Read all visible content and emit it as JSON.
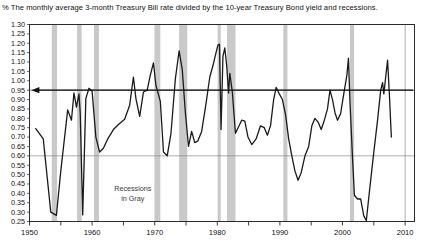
{
  "chart_data": {
    "type": "line",
    "title": "The monthly average 3-month Treasury Bill rate divided by the 10-year Treasury Bond yield and recessions.",
    "unit_symbol": "%",
    "xlabel": "",
    "ylabel": "",
    "xlim": [
      1950,
      2011.5
    ],
    "ylim": [
      0.25,
      1.3
    ],
    "grid": true,
    "gridlines_y": [
      0.6,
      0.95
    ],
    "gridlines_x": [
      2010
    ],
    "legend_position": "none",
    "annotations": [
      {
        "name": "recessions-in-gray",
        "text_line1": "Recessions",
        "text_line2": "in Gray",
        "x": 1966.5,
        "y": 0.4
      },
      {
        "name": "level-arrow",
        "text": "",
        "y": 0.95,
        "direction": "left",
        "x_start": 2011.3,
        "x_end": 1950.3
      }
    ],
    "ytick_labels": [
      "1.30",
      "1.25",
      "1.20",
      "1.15",
      "1.10",
      "1.05",
      "1.00",
      "0.95",
      "0.90",
      "0.85",
      "0.80",
      "0.75",
      "0.70",
      "0.65",
      "0.60",
      "0.55",
      "0.50",
      "0.45",
      "0.40",
      "0.35",
      "0.30",
      "0.25"
    ],
    "ytick_values": [
      1.3,
      1.25,
      1.2,
      1.15,
      1.1,
      1.05,
      1.0,
      0.95,
      0.9,
      0.85,
      0.8,
      0.75,
      0.7,
      0.65,
      0.6,
      0.55,
      0.5,
      0.45,
      0.4,
      0.35,
      0.3,
      0.25
    ],
    "xtick_labels": [
      "1950",
      "1960",
      "1970",
      "1980",
      "1990",
      "2000",
      "2010"
    ],
    "xtick_values": [
      1950,
      1960,
      1970,
      1980,
      1990,
      2000,
      2010
    ],
    "xminor_values": [
      1955,
      1965,
      1975,
      1985,
      1995,
      2005
    ],
    "series": [
      {
        "name": "3-month T-Bill rate / 10-year T-Bond yield",
        "color": "#1a1a1a",
        "points": [
          [
            1951.0,
            0.745
          ],
          [
            1952.2,
            0.69
          ],
          [
            1953.4,
            0.3
          ],
          [
            1954.3,
            0.283
          ],
          [
            1955.0,
            0.52
          ],
          [
            1956.1,
            0.845
          ],
          [
            1956.7,
            0.79
          ],
          [
            1957.1,
            0.935
          ],
          [
            1957.5,
            0.86
          ],
          [
            1957.9,
            0.93
          ],
          [
            1958.1,
            0.83
          ],
          [
            1958.5,
            0.285
          ],
          [
            1959.0,
            0.905
          ],
          [
            1959.5,
            0.96
          ],
          [
            1960.0,
            0.945
          ],
          [
            1960.6,
            0.7
          ],
          [
            1961.2,
            0.62
          ],
          [
            1961.8,
            0.64
          ],
          [
            1962.5,
            0.69
          ],
          [
            1963.4,
            0.74
          ],
          [
            1964.3,
            0.77
          ],
          [
            1965.2,
            0.795
          ],
          [
            1966.0,
            0.87
          ],
          [
            1966.6,
            1.02
          ],
          [
            1967.0,
            0.905
          ],
          [
            1967.6,
            0.81
          ],
          [
            1968.2,
            0.94
          ],
          [
            1968.8,
            0.95
          ],
          [
            1969.3,
            1.03
          ],
          [
            1969.8,
            1.095
          ],
          [
            1970.2,
            0.975
          ],
          [
            1970.9,
            0.89
          ],
          [
            1971.4,
            0.62
          ],
          [
            1972.0,
            0.6
          ],
          [
            1972.6,
            0.72
          ],
          [
            1973.3,
            1.01
          ],
          [
            1973.9,
            1.16
          ],
          [
            1974.4,
            1.06
          ],
          [
            1974.9,
            0.83
          ],
          [
            1975.4,
            0.65
          ],
          [
            1975.9,
            0.73
          ],
          [
            1976.4,
            0.67
          ],
          [
            1976.9,
            0.68
          ],
          [
            1977.5,
            0.73
          ],
          [
            1978.2,
            0.88
          ],
          [
            1978.8,
            1.02
          ],
          [
            1979.3,
            1.08
          ],
          [
            1979.8,
            1.15
          ],
          [
            1980.1,
            1.19
          ],
          [
            1980.35,
            1.195
          ],
          [
            1980.6,
            0.74
          ],
          [
            1980.9,
            1.13
          ],
          [
            1981.2,
            1.175
          ],
          [
            1981.5,
            1.08
          ],
          [
            1981.8,
            0.935
          ],
          [
            1982.0,
            1.04
          ],
          [
            1982.4,
            0.94
          ],
          [
            1982.9,
            0.72
          ],
          [
            1983.4,
            0.755
          ],
          [
            1983.9,
            0.79
          ],
          [
            1984.4,
            0.785
          ],
          [
            1984.9,
            0.7
          ],
          [
            1985.5,
            0.66
          ],
          [
            1986.2,
            0.69
          ],
          [
            1986.9,
            0.76
          ],
          [
            1987.5,
            0.75
          ],
          [
            1988.0,
            0.71
          ],
          [
            1988.5,
            0.76
          ],
          [
            1989.0,
            0.9
          ],
          [
            1989.4,
            0.965
          ],
          [
            1989.9,
            0.93
          ],
          [
            1990.4,
            0.9
          ],
          [
            1990.9,
            0.82
          ],
          [
            1991.4,
            0.69
          ],
          [
            1991.9,
            0.6
          ],
          [
            1992.4,
            0.52
          ],
          [
            1992.9,
            0.47
          ],
          [
            1993.4,
            0.51
          ],
          [
            1994.0,
            0.6
          ],
          [
            1994.6,
            0.65
          ],
          [
            1995.1,
            0.76
          ],
          [
            1995.6,
            0.8
          ],
          [
            1996.1,
            0.78
          ],
          [
            1996.6,
            0.74
          ],
          [
            1997.1,
            0.79
          ],
          [
            1997.6,
            0.85
          ],
          [
            1998.0,
            0.95
          ],
          [
            1998.4,
            0.9
          ],
          [
            1998.8,
            0.83
          ],
          [
            1999.2,
            0.79
          ],
          [
            1999.7,
            0.825
          ],
          [
            2000.2,
            0.93
          ],
          [
            2000.7,
            1.03
          ],
          [
            2000.95,
            1.12
          ],
          [
            2001.2,
            0.88
          ],
          [
            2001.6,
            0.59
          ],
          [
            2001.9,
            0.39
          ],
          [
            2002.4,
            0.37
          ],
          [
            2002.9,
            0.37
          ],
          [
            2003.4,
            0.28
          ],
          [
            2003.8,
            0.255
          ],
          [
            2004.4,
            0.44
          ],
          [
            2005.0,
            0.62
          ],
          [
            2005.6,
            0.79
          ],
          [
            2006.1,
            0.95
          ],
          [
            2006.4,
            0.99
          ],
          [
            2006.6,
            0.93
          ],
          [
            2006.9,
            1.02
          ],
          [
            2007.2,
            1.11
          ],
          [
            2007.5,
            0.92
          ],
          [
            2007.8,
            0.7
          ]
        ]
      }
    ],
    "recessions": [
      {
        "name": "1953-1954",
        "start": 1953.55,
        "end": 1954.4
      },
      {
        "name": "1957-1958",
        "start": 1957.6,
        "end": 1958.33
      },
      {
        "name": "1960-1961",
        "start": 1960.3,
        "end": 1961.1
      },
      {
        "name": "1969-1970",
        "start": 1969.95,
        "end": 1970.9
      },
      {
        "name": "1973-1975",
        "start": 1973.9,
        "end": 1975.2
      },
      {
        "name": "1980",
        "start": 1980.05,
        "end": 1980.55
      },
      {
        "name": "1981-1982",
        "start": 1981.55,
        "end": 1982.9
      },
      {
        "name": "1990-1991",
        "start": 1990.55,
        "end": 1991.2
      },
      {
        "name": "2001",
        "start": 2001.2,
        "end": 2001.85
      }
    ],
    "recession_band_color": "#c9c9c9"
  },
  "colors": {
    "line": "#1a1a1a",
    "grid": "#8a8a8a",
    "axis": "#2b2b2b",
    "recession": "#c9c9c9",
    "background": "#ffffff"
  }
}
